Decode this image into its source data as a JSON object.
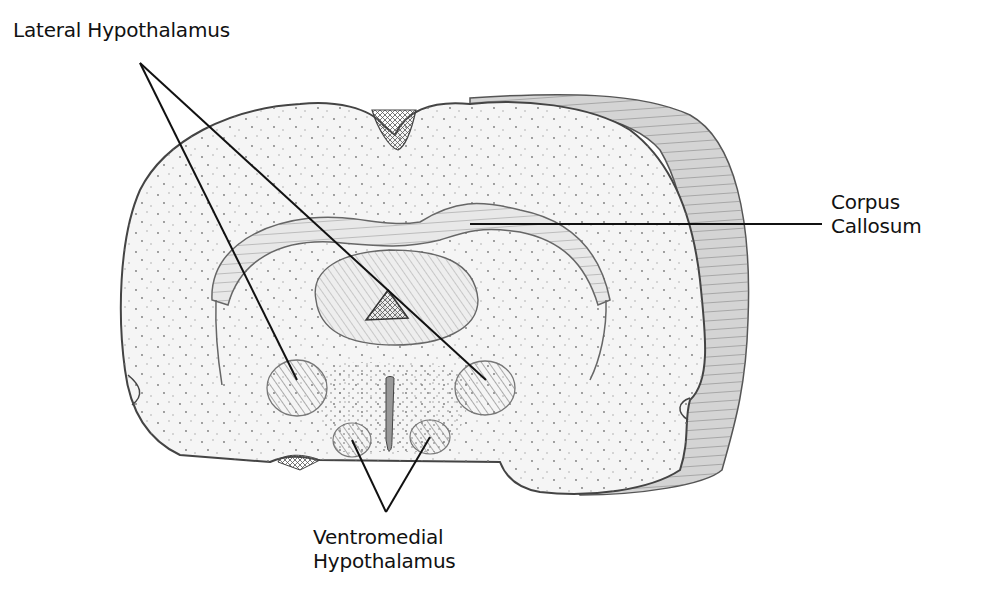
{
  "diagram": {
    "labels": {
      "lateral_hypothalamus": "Lateral Hypothalamus",
      "corpus_callosum_line1": "Corpus",
      "corpus_callosum_line2": "Callosum",
      "ventromedial_line1": "Ventromedial",
      "ventromedial_line2": "Hypothalamus"
    },
    "colors": {
      "background": "#ffffff",
      "ink": "#111111",
      "tissue_fill": "#f4f4f4",
      "hatch": "#8a8a8a",
      "slab": "#c9c9c9"
    }
  }
}
